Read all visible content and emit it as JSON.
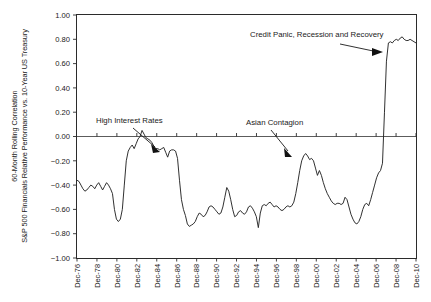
{
  "chart_data": {
    "type": "line",
    "title": "",
    "xlabel": "",
    "ylabel_line1": "60-Month Rolling Correlation",
    "ylabel_line2": "S&P 500 Financials Relative Performance vs. 10-Year US Treasury",
    "ylim": [
      -1.0,
      1.0
    ],
    "ytick_labels": [
      "1.00",
      "0.80",
      "0.60",
      "0.40",
      "0.20",
      "0.00",
      "−0.20",
      "−0.40",
      "−0.60",
      "−0.80",
      "−1.00"
    ],
    "ytick_values": [
      1.0,
      0.8,
      0.6,
      0.4,
      0.2,
      0.0,
      -0.2,
      -0.4,
      -0.6,
      -0.8,
      -1.0
    ],
    "xtick_labels": [
      "Dec-76",
      "Dec-78",
      "Dec-80",
      "Dec-82",
      "Dec-84",
      "Dec-86",
      "Dec-88",
      "Dec-90",
      "Dec-92",
      "Dec-94",
      "Dec-96",
      "Dec-98",
      "Dec-00",
      "Dec-02",
      "Dec-04",
      "Dec-06",
      "Dec-08",
      "Dec-10"
    ],
    "grid": false,
    "legend": "none",
    "line_color": "#262626",
    "zero_line_color": "#4a4a4a",
    "x_start_year": 1976.0,
    "x_end_year": 2011.0,
    "x_step_years": 0.25,
    "series": [
      {
        "name": "60-Month Rolling Correlation",
        "values": [
          -0.36,
          -0.37,
          -0.4,
          -0.43,
          -0.45,
          -0.44,
          -0.42,
          -0.4,
          -0.41,
          -0.43,
          -0.4,
          -0.38,
          -0.41,
          -0.44,
          -0.41,
          -0.38,
          -0.4,
          -0.43,
          -0.47,
          -0.6,
          -0.68,
          -0.7,
          -0.68,
          -0.6,
          -0.4,
          -0.2,
          -0.12,
          -0.09,
          -0.07,
          -0.1,
          -0.06,
          -0.02,
          0.0,
          0.05,
          0.02,
          -0.01,
          -0.02,
          -0.03,
          -0.05,
          -0.08,
          -0.1,
          -0.1,
          -0.11,
          -0.1,
          -0.09,
          -0.13,
          -0.17,
          -0.12,
          -0.11,
          -0.11,
          -0.12,
          -0.18,
          -0.36,
          -0.52,
          -0.6,
          -0.65,
          -0.72,
          -0.74,
          -0.73,
          -0.72,
          -0.7,
          -0.66,
          -0.63,
          -0.64,
          -0.66,
          -0.65,
          -0.62,
          -0.58,
          -0.57,
          -0.58,
          -0.6,
          -0.62,
          -0.64,
          -0.63,
          -0.58,
          -0.5,
          -0.42,
          -0.45,
          -0.52,
          -0.6,
          -0.66,
          -0.65,
          -0.62,
          -0.61,
          -0.63,
          -0.64,
          -0.62,
          -0.58,
          -0.57,
          -0.59,
          -0.62,
          -0.66,
          -0.75,
          -0.63,
          -0.57,
          -0.56,
          -0.57,
          -0.55,
          -0.54,
          -0.56,
          -0.58,
          -0.57,
          -0.58,
          -0.6,
          -0.61,
          -0.6,
          -0.58,
          -0.57,
          -0.58,
          -0.57,
          -0.54,
          -0.47,
          -0.38,
          -0.28,
          -0.2,
          -0.16,
          -0.14,
          -0.16,
          -0.19,
          -0.18,
          -0.2,
          -0.26,
          -0.32,
          -0.28,
          -0.32,
          -0.38,
          -0.43,
          -0.47,
          -0.5,
          -0.53,
          -0.55,
          -0.56,
          -0.55,
          -0.55,
          -0.56,
          -0.55,
          -0.5,
          -0.52,
          -0.58,
          -0.64,
          -0.68,
          -0.71,
          -0.72,
          -0.7,
          -0.66,
          -0.6,
          -0.56,
          -0.55,
          -0.57,
          -0.52,
          -0.46,
          -0.4,
          -0.34,
          -0.3,
          -0.28,
          -0.22,
          0.2,
          0.62,
          0.77,
          0.78,
          0.77,
          0.79,
          0.8,
          0.79,
          0.81,
          0.82,
          0.8,
          0.79,
          0.79,
          0.8,
          0.79,
          0.78,
          0.77
        ]
      }
    ],
    "annotations": [
      {
        "id": "high-interest-rates",
        "label": "High Interest Rates",
        "label_x": 96,
        "label_y": 123,
        "leader_from_x": 133,
        "leader_from_y": 128,
        "leader_to_x": 156,
        "leader_to_y": 150,
        "target_value": 0.05,
        "target_period": "Dec-82"
      },
      {
        "id": "asian-contagion",
        "label": "Asian Contagion",
        "label_x": 246,
        "label_y": 125,
        "leader_from_x": 270,
        "leader_from_y": 130,
        "leader_to_x": 288,
        "leader_to_y": 155,
        "target_value": -0.14,
        "target_period": "Dec-98"
      },
      {
        "id": "credit-panic",
        "label": "Credit Panic, Recession and Recovery",
        "label_x": 250,
        "label_y": 37,
        "leader_from_x": 340,
        "leader_from_y": 46,
        "leader_to_x": 378,
        "leader_to_y": 52,
        "target_value": 0.77,
        "target_period": "Dec-08"
      }
    ]
  }
}
